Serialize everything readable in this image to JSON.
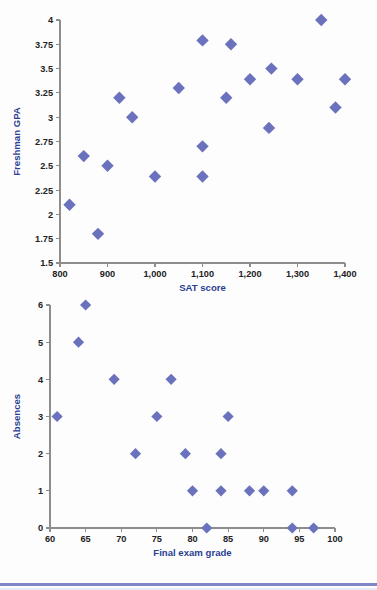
{
  "chart_data": [
    {
      "type": "scatter",
      "title": "",
      "xlabel": "SAT score",
      "ylabel": "Freshman GPA",
      "xlim": [
        800,
        1400
      ],
      "ylim": [
        1.5,
        4
      ],
      "grid": false,
      "legend": "none",
      "marker": "diamond",
      "marker_color": "#6b72bd",
      "axis_label_color": "#2b3f93",
      "xticks": [
        800,
        900,
        1000,
        1100,
        1200,
        1300,
        1400
      ],
      "xticklabels": [
        "800",
        "900",
        "1,000",
        "1,100",
        "1,200",
        "1,300",
        "1,400"
      ],
      "yticks": [
        1.5,
        1.75,
        2,
        2.25,
        2.5,
        2.75,
        3,
        3.25,
        3.5,
        3.75,
        4
      ],
      "yticklabels": [
        "1.5",
        "1.75",
        "2",
        "2.25",
        "2.5",
        "2.75",
        "3",
        "3.25",
        "3.5",
        "3.75",
        "4"
      ],
      "points": [
        {
          "x": 820,
          "y": 2.1
        },
        {
          "x": 850,
          "y": 2.6
        },
        {
          "x": 880,
          "y": 1.8
        },
        {
          "x": 900,
          "y": 2.5
        },
        {
          "x": 925,
          "y": 3.2
        },
        {
          "x": 952,
          "y": 3.0
        },
        {
          "x": 1000,
          "y": 2.39
        },
        {
          "x": 1050,
          "y": 3.3
        },
        {
          "x": 1100,
          "y": 3.79
        },
        {
          "x": 1100,
          "y": 2.7
        },
        {
          "x": 1100,
          "y": 2.39
        },
        {
          "x": 1150,
          "y": 3.2
        },
        {
          "x": 1160,
          "y": 3.75
        },
        {
          "x": 1200,
          "y": 3.39
        },
        {
          "x": 1240,
          "y": 2.89
        },
        {
          "x": 1245,
          "y": 3.5
        },
        {
          "x": 1300,
          "y": 3.39
        },
        {
          "x": 1350,
          "y": 4.0
        },
        {
          "x": 1380,
          "y": 3.1
        },
        {
          "x": 1400,
          "y": 3.39
        }
      ]
    },
    {
      "type": "scatter",
      "title": "",
      "xlabel": "Final exam grade",
      "ylabel": "Absences",
      "xlim": [
        60,
        100
      ],
      "ylim": [
        0,
        6
      ],
      "grid": false,
      "legend": "none",
      "marker": "diamond",
      "marker_color": "#6b72bd",
      "axis_label_color": "#2b3f93",
      "xticks": [
        60,
        65,
        70,
        75,
        80,
        85,
        90,
        95,
        100
      ],
      "xticklabels": [
        "60",
        "65",
        "70",
        "75",
        "80",
        "85",
        "90",
        "95",
        "100"
      ],
      "yticks": [
        0,
        1,
        2,
        3,
        4,
        5,
        6
      ],
      "yticklabels": [
        "0",
        "1",
        "2",
        "3",
        "4",
        "5",
        "6"
      ],
      "points": [
        {
          "x": 61,
          "y": 3
        },
        {
          "x": 64,
          "y": 5
        },
        {
          "x": 65,
          "y": 6
        },
        {
          "x": 69,
          "y": 4
        },
        {
          "x": 72,
          "y": 2
        },
        {
          "x": 75,
          "y": 3
        },
        {
          "x": 77,
          "y": 4
        },
        {
          "x": 79,
          "y": 2
        },
        {
          "x": 80,
          "y": 1
        },
        {
          "x": 82,
          "y": 0
        },
        {
          "x": 84,
          "y": 2
        },
        {
          "x": 84,
          "y": 1
        },
        {
          "x": 85,
          "y": 3
        },
        {
          "x": 88,
          "y": 1
        },
        {
          "x": 90,
          "y": 1
        },
        {
          "x": 94,
          "y": 1
        },
        {
          "x": 94,
          "y": 0
        },
        {
          "x": 97,
          "y": 0
        }
      ]
    }
  ]
}
